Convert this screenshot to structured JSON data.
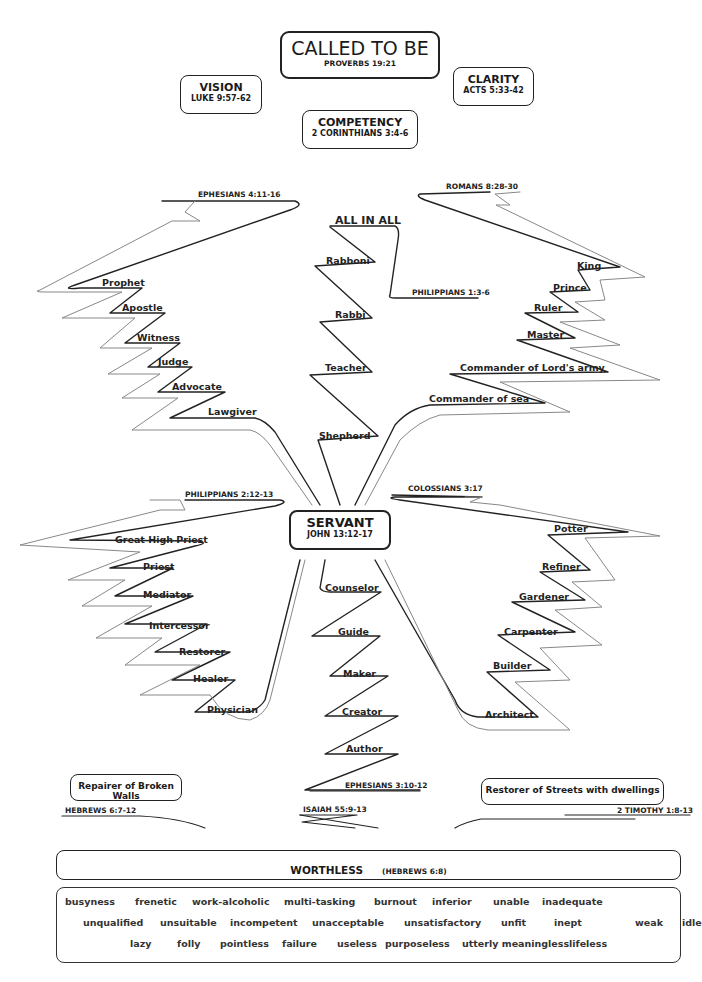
{
  "top": {
    "title": "CALLED TO BE",
    "title_ref": "PROVERBS 19:21",
    "vision": "VISION",
    "vision_ref": "LUKE 9:57-62",
    "clarity": "CLARITY",
    "clarity_ref": "ACTS 5:33-42",
    "competency": "COMPETENCY",
    "competency_ref": "2 CORINTHIANS 3:4-6"
  },
  "center": {
    "title": "SERVANT",
    "ref": "JOHN 13:12-17"
  },
  "branches": {
    "upper_left": {
      "ref": "EPHESIANS 4:11-16",
      "items": [
        "Prophet",
        "Apostle",
        "Witness",
        "Judge",
        "Advocate",
        "Lawgiver"
      ]
    },
    "upper_middle": {
      "heading": "ALL IN ALL",
      "ref": "PHILIPPIANS 1:3-6",
      "items": [
        "Rabboni",
        "Rabbi",
        "Teacher",
        "Shepherd"
      ]
    },
    "upper_right": {
      "ref": "ROMANS 8:28-30",
      "items": [
        "King",
        "Prince",
        "Ruler",
        "Master",
        "Commander of Lord's army",
        "Commander of sea"
      ]
    },
    "lower_left": {
      "ref": "PHILIPPIANS 2:12-13",
      "items": [
        "Great High Priest",
        "Priest",
        "Mediator",
        "Intercessor",
        "Restorer",
        "Healer",
        "Physician"
      ]
    },
    "lower_middle": {
      "ref": "EPHESIANS 3:10-12",
      "items": [
        "Counselor",
        "Guide",
        "Maker",
        "Creator",
        "Author"
      ]
    },
    "lower_right": {
      "ref": "COLOSSIANS 3:17",
      "items": [
        "Potter",
        "Refiner",
        "Gardener",
        "Carpenter",
        "Builder",
        "Architect"
      ]
    }
  },
  "side_boxes": {
    "left": "Repairer of Broken Walls",
    "right": "Restorer of Streets with dwellings"
  },
  "bottom": {
    "refs": [
      "HEBREWS 6:7-12",
      "ISAIAH 55:9-13",
      "2 TIMOTHY 1:8-13"
    ],
    "worthless_title": "WORTHLESS",
    "worthless_ref": "(HEBREWS 6:8)",
    "words_rows": [
      [
        "busyness",
        "frenetic",
        "work-alcoholic",
        "multi-tasking",
        "burnout",
        "inferior",
        "unable",
        "inadequate"
      ],
      [
        "unqualified",
        "unsuitable",
        "incompetent",
        "unacceptable",
        "unsatisfactory",
        "unfit",
        "inept",
        "weak",
        "idle"
      ],
      [
        "lazy",
        "folly",
        "pointless",
        "failure",
        "useless",
        "purposeless",
        "utterly meaningless",
        "lifeless"
      ]
    ]
  }
}
